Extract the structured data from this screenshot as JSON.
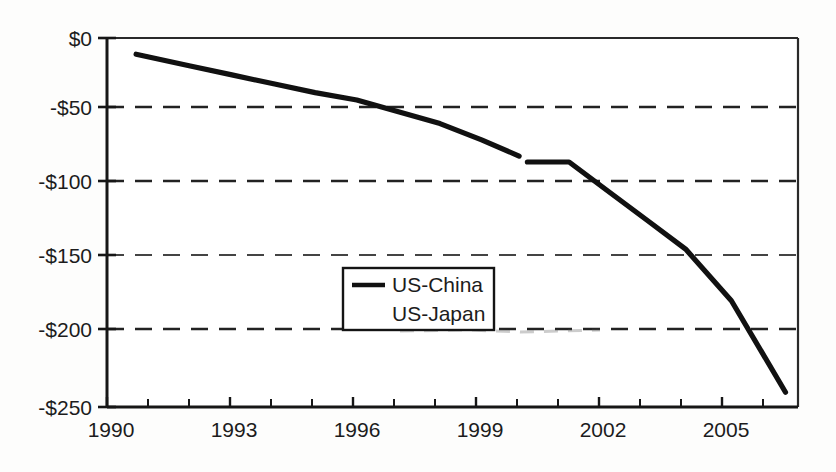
{
  "chart_data": {
    "type": "line",
    "title": "",
    "subtitle": "",
    "xlabel": "",
    "ylabel": "",
    "xlim": [
      1990,
      2006.6
    ],
    "ylim": [
      -250,
      0
    ],
    "grid": "horizontal-dashed",
    "legend_position": "center",
    "x_tick_labels": [
      "1990",
      "1993",
      "1996",
      "1999",
      "2002",
      "2005"
    ],
    "x_tick_values": [
      1990,
      1993,
      1996,
      1999,
      2002,
      2005
    ],
    "x_minor_tick_values": [
      1991,
      1992,
      1994,
      1995,
      1997,
      1998,
      2000,
      2001,
      2003,
      2004,
      2006
    ],
    "y_tick_labels": [
      "$0",
      "-$50",
      "-$100",
      "-$150",
      "-$200",
      "-$250"
    ],
    "y_tick_values": [
      0,
      -50,
      -100,
      -150,
      -200,
      -250
    ],
    "units_note": "billions of US dollars",
    "legend": [
      {
        "name": "US-China",
        "swatch": "solid-line",
        "color": "#111111"
      },
      {
        "name": "US-Japan",
        "swatch": "none",
        "color": "#111111"
      }
    ],
    "series": [
      {
        "name": "US-China",
        "color": "#111111",
        "style": "solid",
        "x": [
          1990.7,
          1992.0,
          1993.0,
          1994.0,
          1995.0,
          1996.0,
          1997.0,
          1998.0,
          1999.0,
          1999.9,
          2000.1,
          2001.1,
          2002.0,
          2003.0,
          2003.9,
          2005.0,
          2006.3
        ],
        "values": [
          -11,
          -19,
          -25,
          -31,
          -37,
          -42,
          -50,
          -58,
          -69,
          -80,
          -84,
          -84,
          -103,
          -124,
          -143,
          -178,
          -240
        ]
      },
      {
        "name": "US-Japan",
        "color": "#111111",
        "style": "faded",
        "x": [],
        "values": []
      }
    ],
    "annotations": [
      {
        "kind": "line-break",
        "x": 2000.0,
        "note": "small gap / discontinuity in the traced line near 2000"
      }
    ]
  },
  "legend_box": {
    "items": [
      "US-China",
      "US-Japan"
    ]
  }
}
